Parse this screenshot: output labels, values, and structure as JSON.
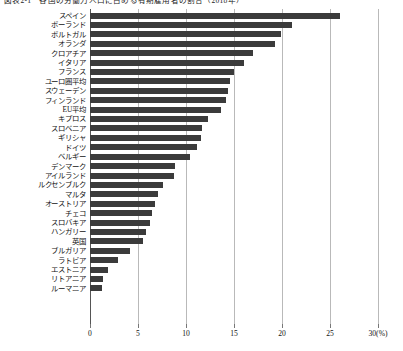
{
  "title": "図表2-1　各国の労働力人口に占める有期雇用者の割合（2018年）",
  "axis": {
    "unit_label": "(%)",
    "ticks": [
      0,
      5,
      10,
      15,
      20,
      25,
      30
    ],
    "tick_labels": [
      "0",
      "5",
      "10",
      "15",
      "20",
      "25",
      "30"
    ],
    "xmin": 0,
    "xmax": 30
  },
  "chart_data": {
    "type": "bar",
    "orientation": "horizontal",
    "title": "図表2-1　各国の労働力人口に占める有期雇用者の割合（2018年）",
    "xlabel": "(%)",
    "ylabel": "",
    "xlim": [
      0,
      30
    ],
    "grid": true,
    "legend": "none",
    "bar_color": "#3b3b3b",
    "categories": [
      "スペイン",
      "ポーランド",
      "ポルトガル",
      "オランダ",
      "クロアチア",
      "イタリア",
      "フランス",
      "ユーロ圏平均",
      "スウェーデン",
      "フィンランド",
      "EU平均",
      "キプロス",
      "スロベニア",
      "ギリシャ",
      "ドイツ",
      "ベルギー",
      "デンマーク",
      "アイルランド",
      "ルクセンブルク",
      "マルタ",
      "オーストリア",
      "チェコ",
      "スロバキア",
      "ハンガリー",
      "英国",
      "ブルガリア",
      "ラトビア",
      "エストニア",
      "リトアニア",
      "ルーマニア"
    ],
    "values": [
      26.0,
      21.0,
      19.9,
      19.3,
      17.0,
      16.0,
      15.0,
      14.6,
      14.4,
      14.2,
      13.6,
      12.3,
      11.7,
      11.6,
      11.1,
      10.4,
      8.9,
      8.7,
      7.6,
      7.1,
      6.8,
      6.5,
      6.3,
      5.8,
      5.5,
      4.2,
      2.9,
      1.9,
      1.4,
      1.3
    ]
  }
}
